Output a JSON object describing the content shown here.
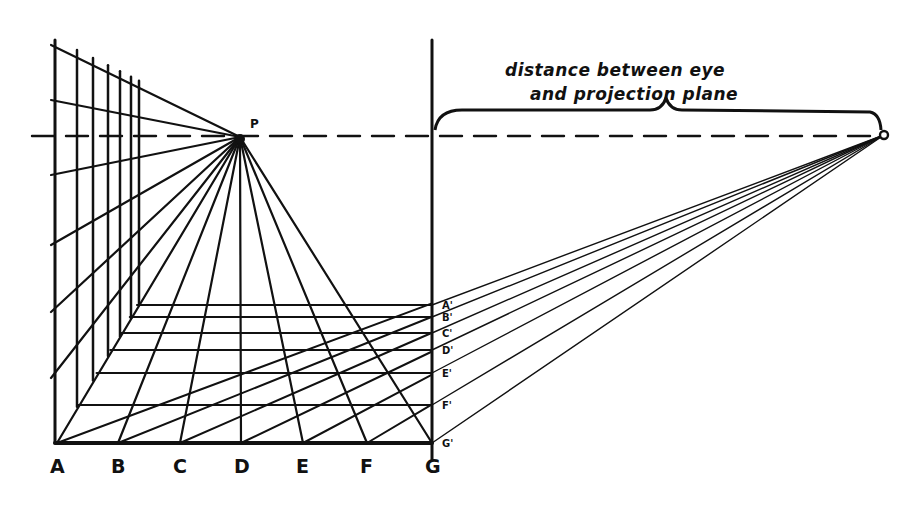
{
  "diagram": {
    "colors": {
      "ink": "#111111",
      "paper": "#ffffff"
    },
    "caption": {
      "line1": "distance between eye",
      "line2": "and projection plane"
    },
    "vanishing_point": {
      "label": "P",
      "x": 240,
      "y": 137
    },
    "distance_point": {
      "label": "O",
      "x": 884,
      "y": 135
    },
    "horizon_y": 136,
    "picture_plane_x": 432,
    "ground_line_y": 443,
    "ground_labels": [
      "A",
      "B",
      "C",
      "D",
      "E",
      "F",
      "G"
    ],
    "ground_x": [
      57,
      118,
      180,
      241,
      303,
      367,
      432
    ],
    "floor_far_edge": {
      "y": 305,
      "x_left": 137,
      "x_right": 347
    },
    "floor_rows_y": [
      305,
      317,
      333,
      350,
      373,
      405,
      443
    ],
    "plane_labels": [
      "A'",
      "B'",
      "C'",
      "D'",
      "E'",
      "F'",
      "G'"
    ],
    "wall_verticals_x": [
      55,
      77,
      93,
      108,
      120,
      131,
      139
    ],
    "wall_ticks_y": [
      45,
      100,
      175,
      245,
      312,
      378
    ]
  }
}
